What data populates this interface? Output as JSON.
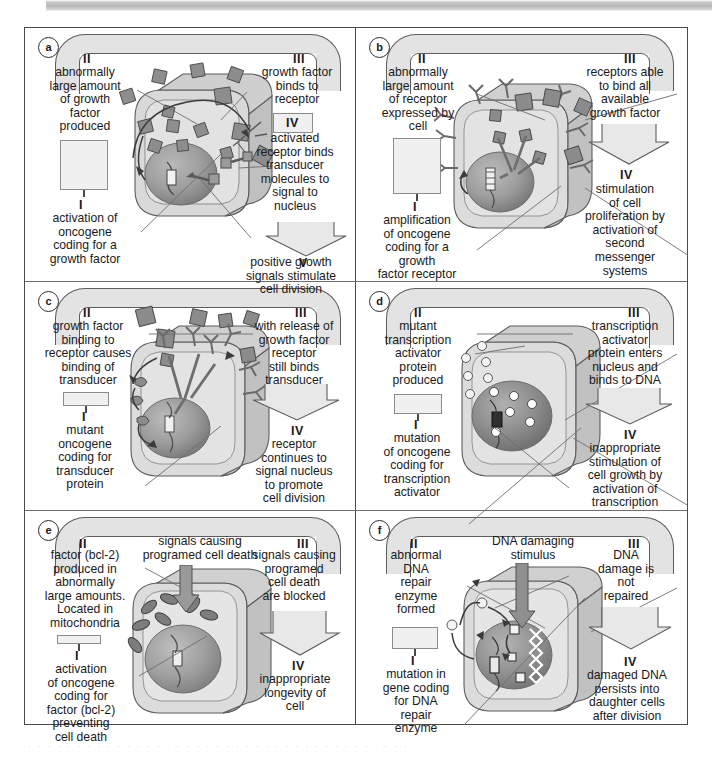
{
  "figure": {
    "panel_count": 6,
    "line_color": "#5d5d5d",
    "fill_grey": "#e3e3e3",
    "cell_grey": "#d4d4d4",
    "nucleus_grey": "#9a9a9a"
  },
  "panels": [
    {
      "id": "a",
      "letter": "a",
      "roman_ii": "II",
      "roman_iii": "III",
      "roman_i": "I",
      "roman_iv": "IV",
      "roman_v": "V",
      "text_ii": "abnormally\nlarge amount\nof growth\nfactor\nproduced",
      "text_i": "activation of\noncogene\ncoding for a\ngrowth factor",
      "text_iii": "growth factor\nbinds to\nreceptor",
      "text_iv": "activated\nreceptor binds\ntransducer\nmolecules to\nsignal to\nnucleus",
      "text_v": "positive growth\nsignals stimulate\ncell division"
    },
    {
      "id": "b",
      "letter": "b",
      "roman_ii": "II",
      "roman_iii": "III",
      "roman_i": "I",
      "roman_iv": "IV",
      "text_ii": "abnormally\nlarge amount\nof receptor\nexpressed by\ncell",
      "text_i": "amplification\nof oncogene\ncoding for a\ngrowth\nfactor receptor",
      "text_iii": "receptors able\nto bind all\navailable\ngrowth factor",
      "text_iv": "stimulation\nof cell\nproliferation by\nactivation of\nsecond\nmessenger\nsystems"
    },
    {
      "id": "c",
      "letter": "c",
      "roman_ii": "II",
      "roman_iii": "III",
      "roman_i": "I",
      "roman_iv": "IV",
      "text_ii": "growth factor\nbinding to\nreceptor causes\nbinding of\ntransducer",
      "text_i": "mutant\noncogene\ncoding for\ntransducer\nprotein",
      "text_iii": "with release of\ngrowth factor\nreceptor\nstill binds\ntransducer",
      "text_iv": "receptor\ncontinues to\nsignal nucleus\nto promote\ncell division"
    },
    {
      "id": "d",
      "letter": "d",
      "roman_ii": "II",
      "roman_iii": "III",
      "roman_i": "I",
      "roman_iv": "IV",
      "text_ii": "mutant\ntranscription\nactivator\nprotein\nproduced",
      "text_i": "mutation\nof oncogene\ncoding for\ntranscription\nactivator",
      "text_iii": "transcription\nactivator\nprotein enters\nnucleus and\nbinds to DNA",
      "text_iv": "inappropriate\nstimulation of\ncell growth by\nactivation of\ntranscription"
    },
    {
      "id": "e",
      "letter": "e",
      "roman_ii": "II",
      "roman_iii": "III",
      "roman_i": "I",
      "roman_iv": "IV",
      "text_ii": "factor (bcl-2)\nproduced in\nabnormally\nlarge amounts.\nLocated in\nmitochondria",
      "text_i": "activation\nof oncogene\ncoding for\nfactor (bcl-2)\npreventing\ncell death",
      "text_centre": "signals causing\nprogramed cell death",
      "text_iii": "signals causing\nprogramed\ncell death\nare blocked",
      "text_iv": "inappropriate\nlongevity of\ncell"
    },
    {
      "id": "f",
      "letter": "f",
      "roman_ii": "II",
      "roman_iii": "III",
      "roman_i": "I",
      "roman_iv": "IV",
      "text_ii": "abnormal\nDNA\nrepair\nenzyme\nformed",
      "text_i": "mutation in\ngene coding\nfor DNA\nrepair\nenzyme",
      "text_centre": "DNA damaging\nstimulus",
      "text_iii": "DNA\ndamage is\nnot\nrepaired",
      "text_iv": "damaged DNA\npersists into\ndaughter cells\nafter division"
    }
  ]
}
